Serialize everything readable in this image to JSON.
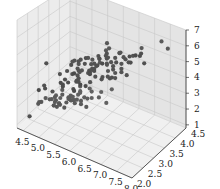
{
  "chart_data": {
    "type": "scatter3d",
    "title": "",
    "xlabel": "",
    "ylabel": "",
    "zlabel": "",
    "x_ticks": [
      "4.5",
      "5.0",
      "5.5",
      "6.0",
      "6.5",
      "7.0",
      "7.5",
      "8.0"
    ],
    "y_ticks": [
      "2.0",
      "2.5",
      "3.0",
      "3.5",
      "4.0",
      "4.5"
    ],
    "z_ticks": [
      "1",
      "2",
      "3",
      "4",
      "5",
      "6",
      "7"
    ],
    "xlim": [
      4.3,
      8.0
    ],
    "ylim": [
      2.0,
      4.5
    ],
    "zlim": [
      0.8,
      7.0
    ],
    "grid": true,
    "marker_color": "#444444",
    "points": [
      [
        5.1,
        3.5,
        1.4
      ],
      [
        4.9,
        3.0,
        1.4
      ],
      [
        4.7,
        3.2,
        1.3
      ],
      [
        4.6,
        3.1,
        1.5
      ],
      [
        5.0,
        3.6,
        1.4
      ],
      [
        5.4,
        3.9,
        1.7
      ],
      [
        4.6,
        3.4,
        1.4
      ],
      [
        5.0,
        3.4,
        1.5
      ],
      [
        4.4,
        2.9,
        1.4
      ],
      [
        4.9,
        3.1,
        1.5
      ],
      [
        5.4,
        3.7,
        1.5
      ],
      [
        4.8,
        3.4,
        1.6
      ],
      [
        4.8,
        3.0,
        1.4
      ],
      [
        4.3,
        3.0,
        1.1
      ],
      [
        5.8,
        4.0,
        1.2
      ],
      [
        5.7,
        4.4,
        1.5
      ],
      [
        5.4,
        3.9,
        1.3
      ],
      [
        5.1,
        3.5,
        1.4
      ],
      [
        5.7,
        3.8,
        1.7
      ],
      [
        5.1,
        3.8,
        1.5
      ],
      [
        5.4,
        3.4,
        1.7
      ],
      [
        5.1,
        3.7,
        1.5
      ],
      [
        4.6,
        3.6,
        1.0
      ],
      [
        5.1,
        3.3,
        1.7
      ],
      [
        4.8,
        3.4,
        1.9
      ],
      [
        5.0,
        3.0,
        1.6
      ],
      [
        5.0,
        3.4,
        1.6
      ],
      [
        5.2,
        3.5,
        1.5
      ],
      [
        5.2,
        3.4,
        1.4
      ],
      [
        4.7,
        3.2,
        1.6
      ],
      [
        4.8,
        3.1,
        1.6
      ],
      [
        5.4,
        3.4,
        1.5
      ],
      [
        5.2,
        4.1,
        1.5
      ],
      [
        5.5,
        4.2,
        1.4
      ],
      [
        4.9,
        3.1,
        1.5
      ],
      [
        5.0,
        3.2,
        1.2
      ],
      [
        5.5,
        3.5,
        1.3
      ],
      [
        4.4,
        3.0,
        1.3
      ],
      [
        5.1,
        3.4,
        1.5
      ],
      [
        5.0,
        3.5,
        1.3
      ],
      [
        4.5,
        2.3,
        1.3
      ],
      [
        4.4,
        3.2,
        1.3
      ],
      [
        5.0,
        3.5,
        1.6
      ],
      [
        5.1,
        3.8,
        1.9
      ],
      [
        4.8,
        3.0,
        1.4
      ],
      [
        5.1,
        3.8,
        1.6
      ],
      [
        4.6,
        3.2,
        1.4
      ],
      [
        5.3,
        3.7,
        1.5
      ],
      [
        5.0,
        3.3,
        1.4
      ],
      [
        7.0,
        3.2,
        4.7
      ],
      [
        6.4,
        3.2,
        4.5
      ],
      [
        6.9,
        3.1,
        4.9
      ],
      [
        5.5,
        2.3,
        4.0
      ],
      [
        6.5,
        2.8,
        4.6
      ],
      [
        5.7,
        2.8,
        4.5
      ],
      [
        6.3,
        3.3,
        4.7
      ],
      [
        4.9,
        2.4,
        3.3
      ],
      [
        6.6,
        2.9,
        4.6
      ],
      [
        5.2,
        2.7,
        3.9
      ],
      [
        5.0,
        2.0,
        3.5
      ],
      [
        5.9,
        3.0,
        4.2
      ],
      [
        6.0,
        2.2,
        4.0
      ],
      [
        6.1,
        2.9,
        4.7
      ],
      [
        5.6,
        2.9,
        3.6
      ],
      [
        6.7,
        3.1,
        4.4
      ],
      [
        5.6,
        3.0,
        4.5
      ],
      [
        5.8,
        2.7,
        4.1
      ],
      [
        6.2,
        2.2,
        4.5
      ],
      [
        5.6,
        2.5,
        3.9
      ],
      [
        5.9,
        3.2,
        4.8
      ],
      [
        6.1,
        2.8,
        4.0
      ],
      [
        6.3,
        2.5,
        4.9
      ],
      [
        6.1,
        2.8,
        4.7
      ],
      [
        6.4,
        2.9,
        4.3
      ],
      [
        6.6,
        3.0,
        4.4
      ],
      [
        6.8,
        2.8,
        4.8
      ],
      [
        6.7,
        3.0,
        5.0
      ],
      [
        6.0,
        2.9,
        4.5
      ],
      [
        5.7,
        2.6,
        3.5
      ],
      [
        5.5,
        2.4,
        3.8
      ],
      [
        5.5,
        2.4,
        3.7
      ],
      [
        5.8,
        2.7,
        3.9
      ],
      [
        6.0,
        2.7,
        5.1
      ],
      [
        5.4,
        3.0,
        4.5
      ],
      [
        6.0,
        3.4,
        4.5
      ],
      [
        6.7,
        3.1,
        4.7
      ],
      [
        6.3,
        2.3,
        4.4
      ],
      [
        5.6,
        3.0,
        4.1
      ],
      [
        5.5,
        2.5,
        4.0
      ],
      [
        5.5,
        2.6,
        4.4
      ],
      [
        6.1,
        3.0,
        4.6
      ],
      [
        5.8,
        2.6,
        4.0
      ],
      [
        5.0,
        2.3,
        3.3
      ],
      [
        5.6,
        2.7,
        4.2
      ],
      [
        5.7,
        3.0,
        4.2
      ],
      [
        5.7,
        2.9,
        4.2
      ],
      [
        6.2,
        2.9,
        4.3
      ],
      [
        5.1,
        2.5,
        3.0
      ],
      [
        5.7,
        2.8,
        4.1
      ],
      [
        6.3,
        3.3,
        6.0
      ],
      [
        5.8,
        2.7,
        5.1
      ],
      [
        7.1,
        3.0,
        5.9
      ],
      [
        6.3,
        2.9,
        5.6
      ],
      [
        6.5,
        3.0,
        5.8
      ],
      [
        7.6,
        3.0,
        6.6
      ],
      [
        4.9,
        2.5,
        4.5
      ],
      [
        7.3,
        2.9,
        6.3
      ],
      [
        6.7,
        2.5,
        5.8
      ],
      [
        7.2,
        3.6,
        6.1
      ],
      [
        6.5,
        3.2,
        5.1
      ],
      [
        6.4,
        2.7,
        5.3
      ],
      [
        6.8,
        3.0,
        5.5
      ],
      [
        5.7,
        2.5,
        5.0
      ],
      [
        5.8,
        2.8,
        5.1
      ],
      [
        6.4,
        3.2,
        5.3
      ],
      [
        6.5,
        3.0,
        5.5
      ],
      [
        7.7,
        3.8,
        6.7
      ],
      [
        7.7,
        2.6,
        6.9
      ],
      [
        6.0,
        2.2,
        5.0
      ],
      [
        6.9,
        3.2,
        5.7
      ],
      [
        5.6,
        2.8,
        4.9
      ],
      [
        7.7,
        2.8,
        6.7
      ],
      [
        6.3,
        2.7,
        4.9
      ],
      [
        6.7,
        3.3,
        5.7
      ],
      [
        7.2,
        3.2,
        6.0
      ],
      [
        6.2,
        2.8,
        4.8
      ],
      [
        6.1,
        3.0,
        4.9
      ],
      [
        6.4,
        2.8,
        5.6
      ],
      [
        7.2,
        3.0,
        5.8
      ],
      [
        7.4,
        2.8,
        6.1
      ],
      [
        7.9,
        3.8,
        6.4
      ],
      [
        6.4,
        2.8,
        5.6
      ],
      [
        6.3,
        2.8,
        5.1
      ],
      [
        6.1,
        2.6,
        5.6
      ],
      [
        7.7,
        3.0,
        6.1
      ],
      [
        6.3,
        3.4,
        5.6
      ],
      [
        6.4,
        3.1,
        5.5
      ],
      [
        6.0,
        3.0,
        4.8
      ],
      [
        6.9,
        3.1,
        5.4
      ],
      [
        6.7,
        3.1,
        5.6
      ],
      [
        6.9,
        3.1,
        5.1
      ],
      [
        6.8,
        3.2,
        5.9
      ],
      [
        6.7,
        3.3,
        5.7
      ],
      [
        6.7,
        3.0,
        5.2
      ],
      [
        6.3,
        2.5,
        5.0
      ],
      [
        6.5,
        3.0,
        5.2
      ],
      [
        6.2,
        3.4,
        5.4
      ],
      [
        5.9,
        3.0,
        5.1
      ]
    ]
  },
  "colors": {
    "pane_left": "#ececec",
    "pane_back": "#e4e4e4",
    "pane_floor": "#f0f0f0",
    "grid": "#c8c8c8",
    "axis": "#333333",
    "marker": "#3a3a3a"
  }
}
